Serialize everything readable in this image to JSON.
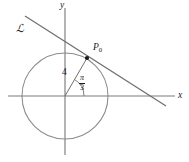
{
  "figure": {
    "background_color": "#ffffff",
    "stroke_color": "#7d7d7d",
    "text_color": "#1a1a1a",
    "width": 189,
    "height": 162
  },
  "axes": {
    "x_label": "x",
    "y_label": "y",
    "origin": {
      "x": 65,
      "y": 96
    },
    "x_start": {
      "x": 8,
      "y": 96
    },
    "x_end": {
      "x": 175,
      "y": 96
    },
    "y_start": {
      "x": 65,
      "y": 8
    },
    "y_end": {
      "x": 65,
      "y": 155
    }
  },
  "circle": {
    "center_x": 65,
    "center_y": 96,
    "radius": 43
  },
  "tangent_line": {
    "label": "ℒ",
    "label_x": 16,
    "label_y": 23,
    "x1": 25,
    "y1": 16,
    "x2": 166,
    "y2": 106
  },
  "radius_segment": {
    "label": "4",
    "label_x": 62,
    "label_y": 68,
    "x1": 65,
    "y1": 96,
    "x2": 87,
    "y2": 58
  },
  "tangent_point": {
    "label_main": "P",
    "label_sub": "0",
    "label_x": 93,
    "label_y": 43,
    "dot_x": 87,
    "dot_y": 58,
    "dot_radius": 2.1
  },
  "angle": {
    "numerator": "π",
    "denominator": "3",
    "degrees": 60,
    "label_x": 79,
    "label_y": 74,
    "arc_radius": 19
  },
  "chart_data": {
    "type": "scatter",
    "xlabel": "x",
    "ylabel": "y",
    "grid": false,
    "legend": "none",
    "annotations": [
      {
        "text": "ℒ",
        "meaning": "tangent line name",
        "x": 16,
        "y": 23
      },
      {
        "text": "P₀",
        "meaning": "point of tangency",
        "x": 93,
        "y": 43
      },
      {
        "text": "4",
        "meaning": "radius length",
        "x": 62,
        "y": 68
      },
      {
        "text": "π/3",
        "meaning": "angle from positive x-axis to radius",
        "x": 79,
        "y": 74
      },
      {
        "text": "x",
        "meaning": "horizontal axis label",
        "x": 178,
        "y": 92
      },
      {
        "text": "y",
        "meaning": "vertical axis label",
        "x": 60,
        "y": 2
      }
    ]
  }
}
